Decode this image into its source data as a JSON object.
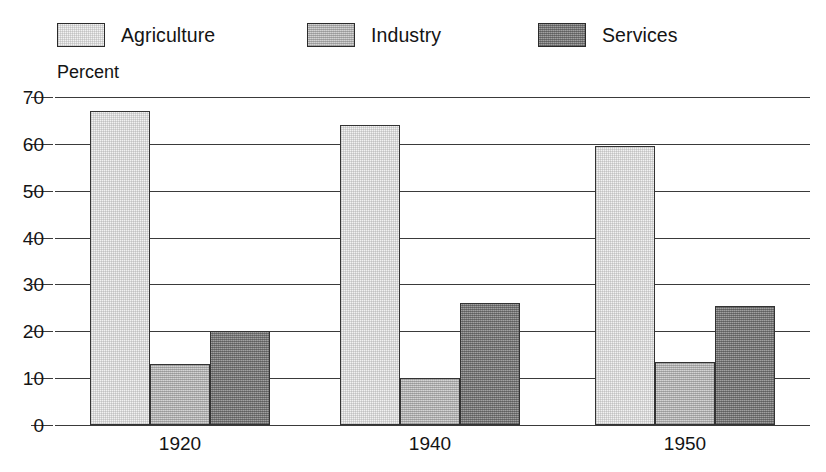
{
  "legend": {
    "items": [
      {
        "label": "Agriculture",
        "key": "agriculture",
        "color": "#f2f2f2"
      },
      {
        "label": "Industry",
        "key": "industry",
        "color": "#c0c0c0"
      },
      {
        "label": "Services",
        "key": "services",
        "color": "#868686"
      }
    ]
  },
  "axis": {
    "y_title": "Percent"
  },
  "chart_data": {
    "type": "bar",
    "title": "",
    "subtitle": "",
    "xlabel": "",
    "ylabel": "Percent",
    "ylim": [
      0,
      70
    ],
    "ytick_step": 10,
    "yticks": [
      0,
      10,
      20,
      30,
      40,
      50,
      60,
      70
    ],
    "ytick_labels": [
      "0",
      "10",
      "20",
      "30",
      "40",
      "50",
      "60",
      "70"
    ],
    "categories": [
      "1920",
      "1940",
      "1950"
    ],
    "grid": true,
    "grid_axis": "y",
    "legend_position": "top",
    "series": [
      {
        "name": "Agriculture",
        "color": "#f2f2f2",
        "values": [
          67,
          64,
          59.5
        ]
      },
      {
        "name": "Industry",
        "color": "#c0c0c0",
        "values": [
          13,
          10,
          13.5
        ]
      },
      {
        "name": "Services",
        "color": "#868686",
        "values": [
          20,
          26,
          25.5
        ]
      }
    ],
    "annotations": []
  }
}
